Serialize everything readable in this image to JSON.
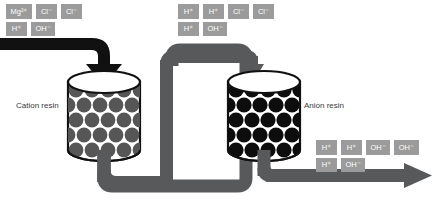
{
  "diagram": {
    "type": "process-flow"
  },
  "colors": {
    "pipe_black": "#111111",
    "pipe_gray": "#58595b",
    "chip_fill": "#9b9b9b",
    "chip_text": "#ffffff",
    "bead_cation": "#565656",
    "bead_anion": "#0d0d0d",
    "vessel_outline": "#111111",
    "vessel_fill": "#ffffff",
    "caption_text": "#3a3a3a",
    "background": "#ffffff"
  },
  "inlet_ions": {
    "name": "feed-water-ions",
    "rows": [
      [
        "Mg²⁺",
        "Cl⁻",
        "Cl⁻"
      ],
      [
        "H⁺",
        "OH⁻"
      ]
    ]
  },
  "mid_ions": {
    "name": "cation-effluent-ions",
    "rows": [
      [
        "H⁺",
        "H⁺",
        "Cl⁻",
        "Cl⁻"
      ],
      [
        "H⁺",
        "OH⁻"
      ]
    ]
  },
  "outlet_ions": {
    "name": "anion-effluent-ions",
    "rows": [
      [
        "H⁺",
        "H⁺",
        "OH⁻",
        "OH⁻"
      ],
      [
        "H⁺",
        "OH⁻"
      ]
    ]
  },
  "vessels": [
    {
      "id": "cation",
      "caption": "Cation resin",
      "bead_style": "gray"
    },
    {
      "id": "anion",
      "caption": "Anion resin",
      "bead_style": "black"
    }
  ],
  "captions": {
    "cation": "Cation resin",
    "anion": "Anion resin"
  }
}
